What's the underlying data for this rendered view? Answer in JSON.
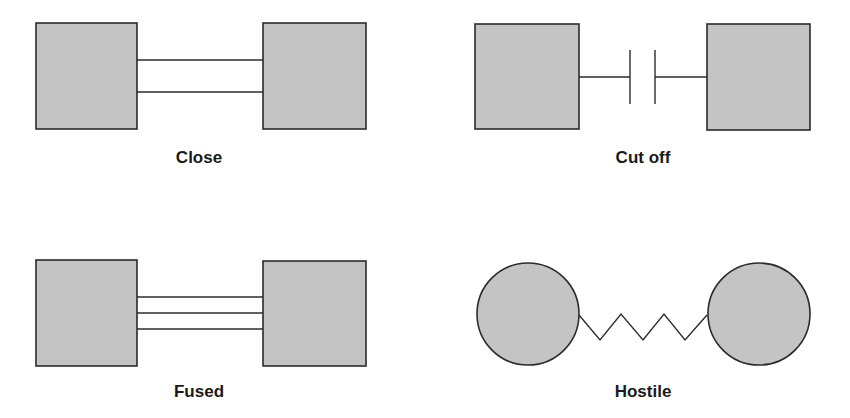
{
  "diagram": {
    "type": "relationship-types",
    "colors": {
      "node_fill": "#c4c4c4",
      "stroke": "#2b2b2b",
      "background": "#ffffff",
      "text": "#1a1a1a"
    },
    "panels": [
      {
        "id": "close",
        "label": "Close",
        "node_shape": "square",
        "connector": "double-line",
        "line_count": 2
      },
      {
        "id": "cut-off",
        "label": "Cut off",
        "node_shape": "square",
        "connector": "broken-line-with-bars"
      },
      {
        "id": "fused",
        "label": "Fused",
        "node_shape": "square",
        "connector": "triple-line",
        "line_count": 3
      },
      {
        "id": "hostile",
        "label": "Hostile",
        "node_shape": "circle",
        "connector": "zigzag"
      }
    ]
  }
}
